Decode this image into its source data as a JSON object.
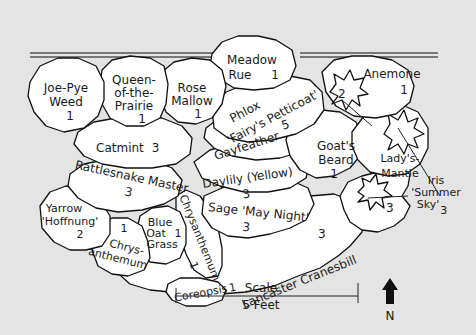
{
  "plants": [
    {
      "name": "Joe-Pye Weed",
      "line1": "Joe-Pye",
      "line2": "Weed",
      "qty": "1"
    },
    {
      "name": "Queen-of-the-Prairie",
      "line1": "Queen-",
      "line2": "of-the-",
      "line3": "Prairie",
      "qty": "1"
    },
    {
      "name": "Rose Mallow",
      "line1": "Rose",
      "line2": "Mallow",
      "qty": "1"
    },
    {
      "name": "Meadow Rue",
      "line1": "Meadow",
      "line2": "Rue",
      "qty": "1"
    },
    {
      "name": "Phlox 'Fairy's Petticoat'",
      "line1": "Phlox",
      "line2": "'Fairy's Petticoat'",
      "qty": "2"
    },
    {
      "name": "Anemone",
      "line1": "Anemone",
      "qty": "1"
    },
    {
      "name": "Catmint",
      "line1": "Catmint",
      "qty": "3"
    },
    {
      "name": "Gayfeather",
      "line1": "Gayfeather",
      "qty": "5"
    },
    {
      "name": "Goat's Beard",
      "line1": "Goat's",
      "line2": "Beard",
      "qty": "1"
    },
    {
      "name": "Lady's-Mantle",
      "line1": "Lady's-",
      "line2": "Mantle"
    },
    {
      "name": "Daylily (Yellow)",
      "line1": "Daylily (Yellow)",
      "qty": "3"
    },
    {
      "name": "Rattlesnake Master",
      "line1": "Rattlesnake Master",
      "qty": "3"
    },
    {
      "name": "Iris 'Summer Sky'",
      "line1": "Iris",
      "line2": "'Summer",
      "line3": "Sky'",
      "qty": "3"
    },
    {
      "name": "Yarrow 'Hoffnung'",
      "line1": "Yarrow",
      "line2": "'Hoffnung'",
      "qty": "2"
    },
    {
      "name": "Chrysanthemum",
      "line1": "Chrys-",
      "line2": "anthemum",
      "qty": "1"
    },
    {
      "name": "Blue Oat Grass",
      "line1": "Blue",
      "line2": "Oat",
      "line3": "Grass",
      "qty": "1"
    },
    {
      "name": "Chrysanthemum (vertical)",
      "line1": "Chrysanthemum",
      "qty": "1"
    },
    {
      "name": "Sage 'May Night'",
      "line1": "Sage 'May Night'",
      "qty": "3"
    },
    {
      "name": "Coreopsis",
      "line1": "Coreopsis",
      "qty": "1"
    },
    {
      "name": "Lancaster Cranesbill",
      "line1": "Lancaster Cranesbill",
      "qty": "3"
    }
  ],
  "scale": {
    "label": "Scale",
    "value": "5 Feet"
  },
  "compass": {
    "label": "N"
  }
}
